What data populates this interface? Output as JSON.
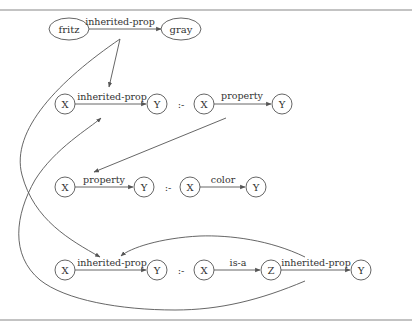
{
  "diagram": {
    "type": "rule-derivation graph",
    "fact": {
      "subject": "fritz",
      "relation": "inherited-prop",
      "object": "gray"
    },
    "neck_symbol": ":-",
    "rules": [
      {
        "head": {
          "from": "X",
          "relation": "inherited-prop",
          "to": "Y"
        },
        "body": [
          {
            "from": "X",
            "relation": "property",
            "to": "Y"
          }
        ]
      },
      {
        "head": {
          "from": "X",
          "relation": "property",
          "to": "Y"
        },
        "body": [
          {
            "from": "X",
            "relation": "color",
            "to": "Y"
          }
        ]
      },
      {
        "head": {
          "from": "X",
          "relation": "inherited-prop",
          "to": "Y"
        },
        "body": [
          {
            "from": "X",
            "relation": "is-a",
            "to": "Z"
          },
          {
            "from": "Z",
            "relation": "inherited-prop",
            "to": "Y"
          }
        ]
      }
    ],
    "colors": {
      "line": "#555555",
      "text": "#333333",
      "border_rule": "#888888",
      "background": "#ffffff"
    }
  }
}
